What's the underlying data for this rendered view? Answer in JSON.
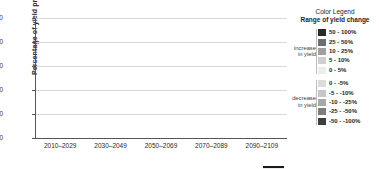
{
  "chart_data": {
    "type": "bar",
    "title": "",
    "xlabel": "",
    "ylabel": "Percentage of yield projections",
    "ylim": [
      0,
      100
    ],
    "yticks": [
      0,
      20,
      40,
      60,
      80,
      100
    ],
    "grid": true,
    "stacked": true,
    "legend_position": "right",
    "categories": [
      "2010–2029",
      "2030–2049",
      "2050–2069",
      "2070–2089",
      "2090–2109"
    ],
    "bars_per_category": 2,
    "series": [
      {
        "name": "-50 - -100%",
        "color": "#3f3f3f",
        "values": [
          [
            3.5,
            1.0
          ],
          [
            3.0,
            11.5
          ],
          [
            1.5,
            1.5
          ],
          [
            1.5,
            2.0
          ],
          [
            1.5,
            18.5
          ]
        ]
      },
      {
        "name": "-25 - -50%",
        "color": "#7d7d7d",
        "values": [
          [
            8.5,
            7.0
          ],
          [
            6.5,
            9.5
          ],
          [
            6.0,
            9.5
          ],
          [
            6.0,
            9.0
          ],
          [
            6.5,
            8.5
          ]
        ]
      },
      {
        "name": "-10 - -25%",
        "color": "#a8a8a8",
        "values": [
          [
            9.0,
            7.0
          ],
          [
            8.5,
            13.0
          ],
          [
            7.5,
            13.5
          ],
          [
            7.0,
            12.0
          ],
          [
            6.5,
            17.0
          ]
        ]
      },
      {
        "name": "-5 - -10%",
        "color": "#c6c6c6",
        "values": [
          [
            6.0,
            5.0
          ],
          [
            4.0,
            6.5
          ],
          [
            5.5,
            9.5
          ],
          [
            5.0,
            9.5
          ],
          [
            4.5,
            15.5
          ]
        ]
      },
      {
        "name": "0 - -5%",
        "color": "#dcdcdc",
        "values": [
          [
            6.0,
            6.0
          ],
          [
            3.5,
            8.5
          ],
          [
            5.5,
            11.0
          ],
          [
            5.0,
            10.5
          ],
          [
            3.0,
            12.0
          ]
        ]
      },
      {
        "name": "0 - 5%",
        "color": "#ededed",
        "values": [
          [
            15.0,
            24.0
          ],
          [
            3.5,
            21.5
          ],
          [
            5.0,
            22.0
          ],
          [
            5.0,
            24.0
          ],
          [
            1.5,
            4.0
          ]
        ]
      },
      {
        "name": "5 - 10%",
        "color": "#cfcfcf",
        "values": [
          [
            0,
            0
          ],
          [
            0,
            0
          ],
          [
            0,
            0
          ],
          [
            0,
            0
          ],
          [
            0,
            0
          ]
        ]
      },
      {
        "name": "10 - 25%",
        "color": "#a0a0a0",
        "values": [
          [
            0,
            0
          ],
          [
            0,
            0
          ],
          [
            0,
            0
          ],
          [
            0,
            0
          ],
          [
            0,
            0
          ]
        ]
      },
      {
        "name": "25 - 50%",
        "color": "#6e6e6e",
        "values": [
          [
            0,
            0
          ],
          [
            0,
            0
          ],
          [
            0,
            0
          ],
          [
            0,
            0
          ],
          [
            0,
            0
          ]
        ]
      },
      {
        "name": "50 - 100%",
        "color": "#2a2a2a",
        "values": [
          [
            0,
            0
          ],
          [
            0,
            0
          ],
          [
            0,
            0
          ],
          [
            0,
            0
          ],
          [
            0,
            0
          ]
        ]
      }
    ],
    "bar_totals": [
      [
        48.0,
        50.0
      ],
      [
        29.0,
        70.5
      ],
      [
        31.0,
        67.0
      ],
      [
        29.5,
        67.0
      ],
      [
        23.5,
        75.5
      ]
    ]
  },
  "legend": {
    "title": "Color Legend",
    "subtitle": "Range of yield change",
    "increase_label_line1": "increase",
    "increase_label_line2": "in yield",
    "decrease_label_line1": "decrease",
    "decrease_label_line2": "in yield",
    "increase_items": [
      {
        "label": "50 - 100%",
        "color": "#2a2a2a"
      },
      {
        "label": "25 - 50%",
        "color": "#6e6e6e"
      },
      {
        "label": "10 - 25%",
        "color": "#a0a0a0"
      },
      {
        "label": "5 - 10%",
        "color": "#cfcfcf"
      },
      {
        "label": "0 - 5%",
        "color": "#ededed"
      }
    ],
    "decrease_items": [
      {
        "label": "0 - -5%",
        "color": "#dcdcdc"
      },
      {
        "label": "-5 - -10%",
        "color": "#c6c6c6"
      },
      {
        "label": "-10 - -25%",
        "color": "#a8a8a8"
      },
      {
        "label": "-25 - -50%",
        "color": "#7d7d7d"
      },
      {
        "label": "-50 - -100%",
        "color": "#3f3f3f"
      }
    ]
  }
}
